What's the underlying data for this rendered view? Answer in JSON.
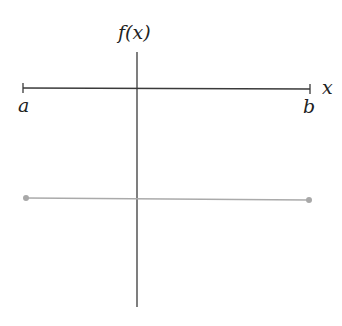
{
  "diagram": {
    "y_axis_label": "f(x)",
    "x_axis_label": "x",
    "interval_start_label": "a",
    "interval_end_label": "b",
    "colors": {
      "axis": "#3a3a3a",
      "function_line": "#aaaaaa",
      "endpoint_dot": "#a8a8a8",
      "text": "#222222"
    },
    "function_segment": {
      "description": "constant function segment from a to b below the x-axis",
      "start_point": [
        26,
        198
      ],
      "end_point": [
        309,
        200
      ]
    }
  }
}
